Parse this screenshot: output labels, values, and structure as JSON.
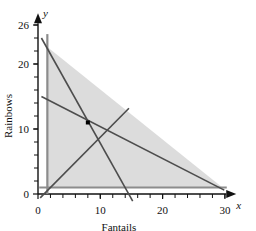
{
  "chart_data": {
    "type": "line",
    "title": "",
    "xlabel": "Fantails",
    "ylabel": "Rainbows",
    "xlim": [
      0,
      31.5
    ],
    "ylim": [
      -1.5,
      27.5
    ],
    "grid": false,
    "legend": "none",
    "x_axis_letter": "x",
    "y_axis_letter": "y",
    "x_tick_labels": [
      "0",
      "10",
      "20",
      "30"
    ],
    "x_tick_values": [
      0,
      10,
      20,
      30
    ],
    "y_tick_labels": [
      "0",
      "10",
      "20",
      "26"
    ],
    "y_tick_values": [
      0,
      10,
      20,
      26
    ],
    "x_minor_tick_step": 2,
    "y_minor_tick_step": 2,
    "feasible_region": {
      "label": "shaded-feasible-region",
      "fill": "#dcdcdc",
      "vertices": [
        [
          1.5,
          1.0
        ],
        [
          1.5,
          22.6
        ],
        [
          29.6,
          1.0
        ]
      ]
    },
    "series": [
      {
        "name": "constraint-vertical",
        "style": "solid",
        "color": "#8c8c8c",
        "width": 2.2,
        "points": [
          [
            1.5,
            24.6
          ],
          [
            1.5,
            0.0
          ]
        ]
      },
      {
        "name": "constraint-horizontal",
        "style": "solid",
        "color": "#8c8c8c",
        "width": 2.2,
        "points": [
          [
            0.2,
            1.0
          ],
          [
            30.3,
            1.0
          ]
        ]
      },
      {
        "name": "constraint-steep",
        "style": "solid",
        "color": "#4d4d4d",
        "width": 1.6,
        "points": [
          [
            0.55,
            24.0
          ],
          [
            15.2,
            -1.1
          ]
        ]
      },
      {
        "name": "constraint-shallow",
        "style": "solid",
        "color": "#4d4d4d",
        "width": 1.6,
        "points": [
          [
            0.55,
            15.0
          ],
          [
            29.9,
            0.6
          ]
        ]
      },
      {
        "name": "objective-line",
        "style": "solid",
        "color": "#4d4d4d",
        "width": 1.6,
        "points": [
          [
            0.35,
            -0.6
          ],
          [
            14.6,
            13.2
          ]
        ]
      }
    ],
    "points": [
      {
        "name": "optimal-vertex",
        "x": 8.0,
        "y": 11.0,
        "marker": "square",
        "color": "#000000",
        "size": 4
      }
    ]
  }
}
